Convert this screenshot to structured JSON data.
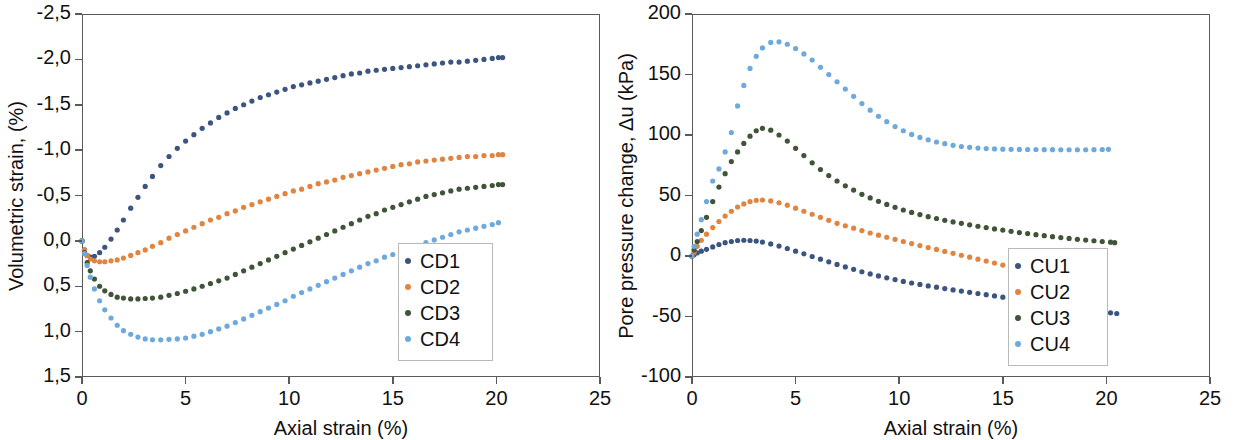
{
  "figure": {
    "panels": [
      "volumetric-strain-panel",
      "pore-pressure-panel"
    ]
  },
  "chart_data": [
    {
      "type": "scatter",
      "id": "cd",
      "title": "",
      "xlabel": "Axial strain (%)",
      "ylabel": "Volumetric strain, (%)",
      "xlim": [
        0,
        25
      ],
      "ylim": [
        -2.5,
        1.5
      ],
      "y_inverted": true,
      "grid": false,
      "decimal_separator": ",",
      "xticks": [
        0,
        5,
        10,
        15,
        20,
        25
      ],
      "xticklabels": [
        "0",
        "5",
        "10",
        "15",
        "20",
        "25"
      ],
      "yticks": [
        -2.5,
        -2.0,
        -1.5,
        -1.0,
        -0.5,
        0.0,
        0.5,
        1.0,
        1.5
      ],
      "yticklabels": [
        "-2,5",
        "-2,0",
        "-1,5",
        "-1,0",
        "-0,5",
        "0,0",
        "0,5",
        "1,0",
        "1,5"
      ],
      "legend_position": "right-inside",
      "series": [
        {
          "name": "CD1",
          "color": "#3c5580",
          "x": [
            0.0,
            0.12,
            0.25,
            0.4,
            0.6,
            0.85,
            1.1,
            1.4,
            1.7,
            2.0,
            2.35,
            2.7,
            3.05,
            3.4,
            3.8,
            4.2,
            4.6,
            5.0,
            5.4,
            5.8,
            6.2,
            6.6,
            7.0,
            7.4,
            7.8,
            8.2,
            8.6,
            9.0,
            9.4,
            9.8,
            10.2,
            10.6,
            11.0,
            11.4,
            11.8,
            12.2,
            12.6,
            13.0,
            13.4,
            13.8,
            14.2,
            14.6,
            15.0,
            15.4,
            15.8,
            16.2,
            16.6,
            17.0,
            17.4,
            17.8,
            18.2,
            18.6,
            19.0,
            19.4,
            19.8,
            20.1,
            20.3
          ],
          "y": [
            0.0,
            0.1,
            0.16,
            0.18,
            0.17,
            0.13,
            0.07,
            -0.02,
            -0.12,
            -0.23,
            -0.36,
            -0.48,
            -0.6,
            -0.71,
            -0.83,
            -0.93,
            -1.02,
            -1.1,
            -1.17,
            -1.24,
            -1.3,
            -1.36,
            -1.41,
            -1.46,
            -1.5,
            -1.54,
            -1.58,
            -1.61,
            -1.64,
            -1.67,
            -1.7,
            -1.72,
            -1.74,
            -1.76,
            -1.78,
            -1.8,
            -1.82,
            -1.84,
            -1.85,
            -1.87,
            -1.88,
            -1.89,
            -1.9,
            -1.91,
            -1.92,
            -1.93,
            -1.94,
            -1.95,
            -1.96,
            -1.97,
            -1.97,
            -1.98,
            -1.99,
            -2.0,
            -2.01,
            -2.02,
            -2.02
          ]
        },
        {
          "name": "CD2",
          "color": "#e08440",
          "x": [
            0.0,
            0.12,
            0.25,
            0.4,
            0.6,
            0.85,
            1.1,
            1.4,
            1.7,
            2.0,
            2.35,
            2.7,
            3.05,
            3.4,
            3.8,
            4.2,
            4.6,
            5.0,
            5.4,
            5.8,
            6.2,
            6.6,
            7.0,
            7.4,
            7.8,
            8.2,
            8.6,
            9.0,
            9.4,
            9.8,
            10.2,
            10.6,
            11.0,
            11.4,
            11.8,
            12.2,
            12.6,
            13.0,
            13.4,
            13.8,
            14.2,
            14.6,
            15.0,
            15.4,
            15.8,
            16.2,
            16.6,
            17.0,
            17.4,
            17.8,
            18.2,
            18.6,
            19.0,
            19.4,
            19.8,
            20.1,
            20.3
          ],
          "y": [
            0.0,
            0.1,
            0.16,
            0.2,
            0.22,
            0.23,
            0.23,
            0.22,
            0.21,
            0.19,
            0.16,
            0.13,
            0.1,
            0.06,
            0.02,
            -0.03,
            -0.07,
            -0.11,
            -0.15,
            -0.19,
            -0.23,
            -0.26,
            -0.3,
            -0.33,
            -0.37,
            -0.4,
            -0.43,
            -0.46,
            -0.49,
            -0.52,
            -0.55,
            -0.57,
            -0.6,
            -0.63,
            -0.65,
            -0.67,
            -0.7,
            -0.72,
            -0.74,
            -0.76,
            -0.78,
            -0.8,
            -0.82,
            -0.84,
            -0.85,
            -0.87,
            -0.88,
            -0.89,
            -0.9,
            -0.91,
            -0.92,
            -0.93,
            -0.93,
            -0.94,
            -0.94,
            -0.95,
            -0.95
          ]
        },
        {
          "name": "CD3",
          "color": "#3f5438",
          "x": [
            0.0,
            0.12,
            0.25,
            0.4,
            0.6,
            0.85,
            1.1,
            1.4,
            1.7,
            2.0,
            2.35,
            2.7,
            3.05,
            3.4,
            3.8,
            4.2,
            4.6,
            5.0,
            5.4,
            5.8,
            6.2,
            6.6,
            7.0,
            7.4,
            7.8,
            8.2,
            8.6,
            9.0,
            9.4,
            9.8,
            10.2,
            10.6,
            11.0,
            11.4,
            11.8,
            12.2,
            12.6,
            13.0,
            13.4,
            13.8,
            14.2,
            14.6,
            15.0,
            15.4,
            15.8,
            16.2,
            16.6,
            17.0,
            17.4,
            17.8,
            18.2,
            18.6,
            19.0,
            19.4,
            19.8,
            20.1,
            20.3
          ],
          "y": [
            0.0,
            0.13,
            0.24,
            0.33,
            0.42,
            0.5,
            0.55,
            0.59,
            0.62,
            0.63,
            0.64,
            0.64,
            0.635,
            0.63,
            0.62,
            0.6,
            0.58,
            0.555,
            0.53,
            0.5,
            0.47,
            0.44,
            0.41,
            0.37,
            0.33,
            0.29,
            0.25,
            0.21,
            0.17,
            0.13,
            0.09,
            0.05,
            0.01,
            -0.03,
            -0.07,
            -0.11,
            -0.15,
            -0.19,
            -0.23,
            -0.27,
            -0.3,
            -0.34,
            -0.37,
            -0.4,
            -0.43,
            -0.46,
            -0.49,
            -0.51,
            -0.53,
            -0.55,
            -0.57,
            -0.58,
            -0.59,
            -0.6,
            -0.61,
            -0.62,
            -0.62
          ]
        },
        {
          "name": "CD4",
          "color": "#6ea9dd",
          "x": [
            0.0,
            0.12,
            0.25,
            0.4,
            0.6,
            0.85,
            1.1,
            1.4,
            1.7,
            2.0,
            2.35,
            2.7,
            3.05,
            3.4,
            3.8,
            4.2,
            4.6,
            5.0,
            5.4,
            5.8,
            6.2,
            6.6,
            7.0,
            7.4,
            7.8,
            8.2,
            8.6,
            9.0,
            9.4,
            9.8,
            10.2,
            10.6,
            11.0,
            11.4,
            11.8,
            12.2,
            12.6,
            13.0,
            13.4,
            13.8,
            14.2,
            14.6,
            15.0,
            15.4,
            15.8,
            16.2,
            16.6,
            17.0,
            17.4,
            17.8,
            18.2,
            18.6,
            19.0,
            19.4,
            19.8,
            20.1
          ],
          "y": [
            0.0,
            0.14,
            0.27,
            0.4,
            0.53,
            0.66,
            0.76,
            0.85,
            0.93,
            0.99,
            1.03,
            1.06,
            1.08,
            1.09,
            1.09,
            1.085,
            1.08,
            1.07,
            1.05,
            1.03,
            1.0,
            0.97,
            0.94,
            0.9,
            0.86,
            0.82,
            0.78,
            0.74,
            0.7,
            0.66,
            0.61,
            0.57,
            0.53,
            0.49,
            0.45,
            0.41,
            0.37,
            0.33,
            0.29,
            0.25,
            0.22,
            0.18,
            0.15,
            0.11,
            0.08,
            0.05,
            0.02,
            -0.01,
            -0.04,
            -0.07,
            -0.1,
            -0.12,
            -0.14,
            -0.16,
            -0.18,
            -0.2
          ]
        }
      ]
    },
    {
      "type": "scatter",
      "id": "cu",
      "title": "",
      "xlabel": "Axial strain (%)",
      "ylabel": "Pore pressure change, Δu (kPa)",
      "xlim": [
        0,
        25
      ],
      "ylim": [
        -100,
        200
      ],
      "y_inverted": false,
      "grid": false,
      "decimal_separator": ".",
      "xticks": [
        0,
        5,
        10,
        15,
        20,
        25
      ],
      "xticklabels": [
        "0",
        "5",
        "10",
        "15",
        "20",
        "25"
      ],
      "yticks": [
        -100,
        -50,
        0,
        50,
        100,
        150,
        200
      ],
      "yticklabels": [
        "-100",
        "-50",
        "0",
        "50",
        "100",
        "150",
        "200"
      ],
      "legend_position": "right-inside",
      "series": [
        {
          "name": "CU1",
          "color": "#3c5580",
          "x": [
            0.0,
            0.1,
            0.25,
            0.45,
            0.7,
            1.0,
            1.3,
            1.6,
            1.9,
            2.2,
            2.5,
            2.8,
            3.1,
            3.4,
            3.8,
            4.2,
            4.6,
            5.0,
            5.4,
            5.8,
            6.2,
            6.6,
            7.0,
            7.4,
            7.8,
            8.2,
            8.6,
            9.0,
            9.4,
            9.8,
            10.2,
            10.6,
            11.0,
            11.4,
            11.8,
            12.2,
            12.6,
            13.0,
            13.4,
            13.8,
            14.2,
            14.6,
            15.0,
            15.4,
            15.8,
            16.2,
            16.6,
            17.0,
            17.4,
            17.8,
            18.2,
            18.6,
            19.0,
            19.4,
            19.8,
            20.2,
            20.5
          ],
          "y": [
            0.0,
            1.0,
            2.5,
            4.0,
            5.5,
            7.5,
            9.5,
            11.0,
            12.0,
            12.8,
            13.0,
            12.8,
            12.3,
            11.5,
            10.0,
            8.2,
            6.2,
            4.0,
            1.8,
            -0.4,
            -2.6,
            -4.8,
            -7.0,
            -9.0,
            -11.0,
            -13.0,
            -14.8,
            -16.5,
            -18.0,
            -19.5,
            -21.0,
            -22.3,
            -23.5,
            -24.7,
            -25.8,
            -26.9,
            -28.0,
            -29.0,
            -30.0,
            -31.0,
            -32.0,
            -33.0,
            -34.0,
            -35.0,
            -36.0,
            -37.0,
            -38.0,
            -39.0,
            -40.0,
            -41.0,
            -42.0,
            -43.0,
            -44.0,
            -45.0,
            -46.0,
            -47.0,
            -47.5
          ]
        },
        {
          "name": "CU2",
          "color": "#e08440",
          "x": [
            0.0,
            0.1,
            0.25,
            0.45,
            0.7,
            1.0,
            1.3,
            1.6,
            1.9,
            2.2,
            2.5,
            2.8,
            3.1,
            3.4,
            3.8,
            4.2,
            4.6,
            5.0,
            5.4,
            5.8,
            6.2,
            6.6,
            7.0,
            7.4,
            7.8,
            8.2,
            8.6,
            9.0,
            9.4,
            9.8,
            10.2,
            10.6,
            11.0,
            11.4,
            11.8,
            12.2,
            12.6,
            13.0,
            13.4,
            13.8,
            14.2,
            14.6,
            15.0,
            15.4,
            15.8,
            16.2,
            16.6,
            17.0,
            17.4,
            17.8,
            18.2,
            18.6,
            19.0,
            19.4,
            19.8
          ],
          "y": [
            0.0,
            3.0,
            8.0,
            13.0,
            18.0,
            23.5,
            28.5,
            33.0,
            37.0,
            40.5,
            43.0,
            45.0,
            46.0,
            46.3,
            45.5,
            44.0,
            42.0,
            39.5,
            37.0,
            34.5,
            32.0,
            29.5,
            27.0,
            25.0,
            23.0,
            21.0,
            19.0,
            17.2,
            15.5,
            13.8,
            12.0,
            10.3,
            8.6,
            7.0,
            5.4,
            3.8,
            2.2,
            0.6,
            -1.0,
            -2.6,
            -4.2,
            -5.8,
            -7.5,
            -9.2,
            -11.0,
            -12.8,
            -14.6,
            -16.4,
            -18.2,
            -20.0,
            -21.8,
            -23.6,
            -25.5,
            -27.4,
            -29.0
          ]
        },
        {
          "name": "CU3",
          "color": "#3f5438",
          "x": [
            0.0,
            0.1,
            0.25,
            0.45,
            0.7,
            1.0,
            1.3,
            1.6,
            1.9,
            2.2,
            2.5,
            2.8,
            3.1,
            3.4,
            3.8,
            4.2,
            4.6,
            5.0,
            5.4,
            5.8,
            6.2,
            6.6,
            7.0,
            7.4,
            7.8,
            8.2,
            8.6,
            9.0,
            9.4,
            9.8,
            10.2,
            10.6,
            11.0,
            11.4,
            11.8,
            12.2,
            12.6,
            13.0,
            13.4,
            13.8,
            14.2,
            14.6,
            15.0,
            15.4,
            15.8,
            16.2,
            16.6,
            17.0,
            17.4,
            17.8,
            18.2,
            18.6,
            19.0,
            19.4,
            19.8,
            20.2,
            20.4
          ],
          "y": [
            0.0,
            5.0,
            12.0,
            21.0,
            32.0,
            45.0,
            57.0,
            68.0,
            78.0,
            86.0,
            93.0,
            99.0,
            103.5,
            105.5,
            104.0,
            100.0,
            95.0,
            89.0,
            83.0,
            77.0,
            71.5,
            66.5,
            62.0,
            58.0,
            54.5,
            51.0,
            48.0,
            45.2,
            42.6,
            40.2,
            38.0,
            36.0,
            34.2,
            32.5,
            31.0,
            29.5,
            28.2,
            27.0,
            25.8,
            24.6,
            23.5,
            22.4,
            21.4,
            20.4,
            19.4,
            18.5,
            17.6,
            16.8,
            16.0,
            15.2,
            14.5,
            13.8,
            13.2,
            12.6,
            12.0,
            11.4,
            11.0
          ]
        },
        {
          "name": "CU4",
          "color": "#6ea9dd",
          "x": [
            0.0,
            0.1,
            0.25,
            0.45,
            0.7,
            1.0,
            1.3,
            1.6,
            1.9,
            2.2,
            2.5,
            2.8,
            3.1,
            3.4,
            3.8,
            4.2,
            4.6,
            5.0,
            5.4,
            5.8,
            6.2,
            6.6,
            7.0,
            7.4,
            7.8,
            8.2,
            8.6,
            9.0,
            9.4,
            9.8,
            10.2,
            10.6,
            11.0,
            11.4,
            11.8,
            12.2,
            12.6,
            13.0,
            13.4,
            13.8,
            14.2,
            14.6,
            15.0,
            15.4,
            15.8,
            16.2,
            16.6,
            17.0,
            17.4,
            17.8,
            18.2,
            18.6,
            19.0,
            19.4,
            19.8,
            20.1
          ],
          "y": [
            0.0,
            8.0,
            18.0,
            30.0,
            45.0,
            62.0,
            72.0,
            86.0,
            102.0,
            124.0,
            141.0,
            155.0,
            165.0,
            172.0,
            176.5,
            177.0,
            175.0,
            171.5,
            167.0,
            162.0,
            156.0,
            150.0,
            144.0,
            138.0,
            132.0,
            126.0,
            120.5,
            115.5,
            111.0,
            107.0,
            103.5,
            100.5,
            98.0,
            96.0,
            94.2,
            92.8,
            91.5,
            90.5,
            89.8,
            89.2,
            88.8,
            88.5,
            88.3,
            88.2,
            88.1,
            88.0,
            88.0,
            87.9,
            87.9,
            87.8,
            87.8,
            87.8,
            87.8,
            87.9,
            88.0,
            88.2
          ]
        }
      ]
    }
  ]
}
